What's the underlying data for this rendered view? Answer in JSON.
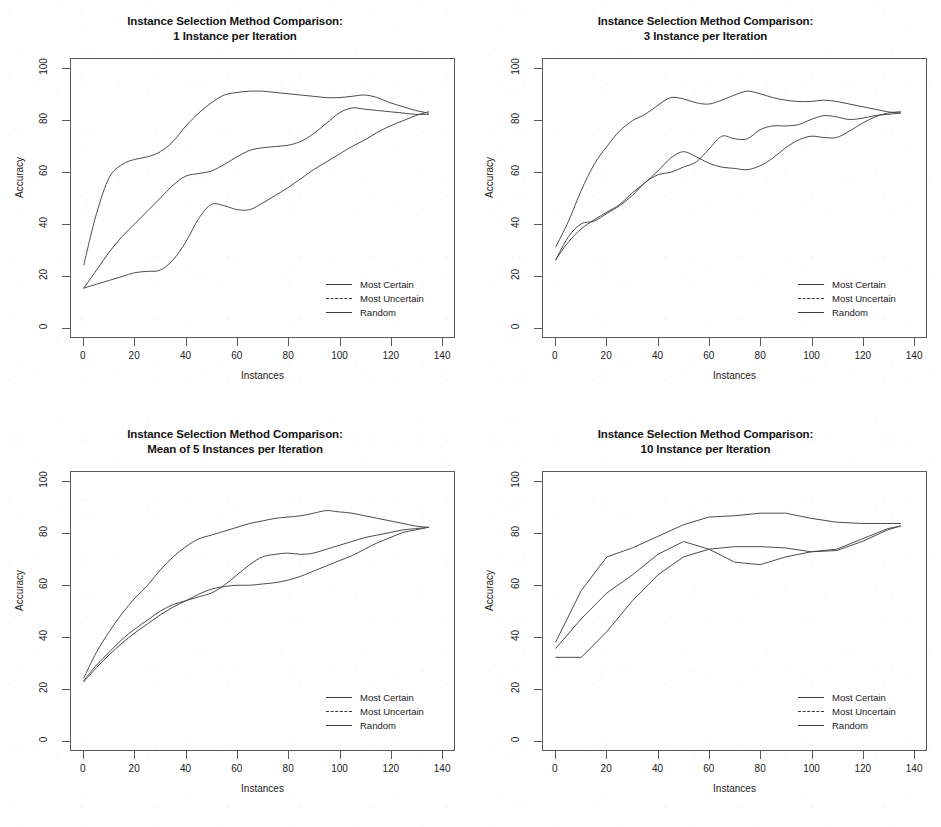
{
  "figure": {
    "title_line1": "Instance Selection Method Comparison:",
    "axis": {
      "xlabel": "Instances",
      "ylabel": "Accuracy",
      "xticks": [
        0,
        20,
        40,
        60,
        80,
        100,
        120,
        140
      ],
      "yticks": [
        0,
        20,
        40,
        60,
        80,
        100
      ],
      "xlim": [
        -5,
        145
      ],
      "ylim": [
        -4,
        104
      ]
    },
    "legend": {
      "entries": [
        {
          "label": "Most Certain",
          "style": "solid",
          "color": "#3a3a3a"
        },
        {
          "label": "Most Uncertain",
          "style": "dashed",
          "color": "#3a3a3a"
        },
        {
          "label": "Random",
          "style": "solid",
          "color": "#3a3a3a"
        }
      ]
    }
  },
  "chart_data": [
    {
      "type": "line",
      "panel": "top-left",
      "title": "Instance Selection Method Comparison:",
      "subtitle": "1 Instance per Iteration",
      "xlabel": "Instances",
      "ylabel": "Accuracy",
      "xlim": [
        -5,
        145
      ],
      "ylim": [
        -4,
        104
      ],
      "xticks": [
        0,
        20,
        40,
        60,
        80,
        100,
        120,
        140
      ],
      "yticks": [
        0,
        20,
        40,
        60,
        80,
        100
      ],
      "grid": false,
      "legend_position": "bottom-right",
      "x": [
        0,
        5,
        10,
        15,
        20,
        25,
        30,
        35,
        40,
        45,
        50,
        55,
        60,
        65,
        70,
        75,
        80,
        85,
        90,
        95,
        100,
        105,
        110,
        115,
        120,
        125,
        130,
        135
      ],
      "series": [
        {
          "name": "Most Certain",
          "values": [
            24,
            44,
            58,
            63,
            65,
            66,
            68,
            72,
            78,
            83,
            87,
            90,
            91,
            91.5,
            91.5,
            91,
            90.5,
            90,
            89.5,
            89,
            89,
            89.5,
            90,
            89,
            87,
            85.5,
            84,
            83
          ]
        },
        {
          "name": "Most Uncertain",
          "values": [
            15,
            22,
            29,
            35,
            40,
            45,
            50,
            55,
            58.5,
            59.5,
            60.5,
            63,
            66,
            68.5,
            69.5,
            70,
            70.5,
            72,
            75,
            79,
            83,
            85,
            84.5,
            84,
            83.5,
            83,
            82.5,
            82.5
          ]
        },
        {
          "name": "Random",
          "values": [
            15,
            16.5,
            18,
            19.5,
            21,
            21.5,
            22,
            26,
            33,
            42,
            47.5,
            47,
            45.5,
            45.5,
            48,
            51,
            54,
            57.5,
            61,
            64,
            67,
            70,
            72.5,
            75.5,
            78,
            80,
            82,
            83.5
          ]
        }
      ]
    },
    {
      "type": "line",
      "panel": "top-right",
      "title": "Instance Selection Method Comparison:",
      "subtitle": "3 Instance per Iteration",
      "xlabel": "Instances",
      "ylabel": "Accuracy",
      "xlim": [
        -5,
        145
      ],
      "ylim": [
        -4,
        104
      ],
      "xticks": [
        0,
        20,
        40,
        60,
        80,
        100,
        120,
        140
      ],
      "yticks": [
        0,
        20,
        40,
        60,
        80,
        100
      ],
      "grid": false,
      "legend_position": "bottom-right",
      "x": [
        0,
        5,
        10,
        15,
        20,
        25,
        30,
        35,
        40,
        45,
        50,
        55,
        60,
        65,
        70,
        75,
        80,
        85,
        90,
        95,
        100,
        105,
        110,
        115,
        120,
        125,
        130,
        135
      ],
      "series": [
        {
          "name": "Most Certain",
          "values": [
            31,
            41,
            53,
            63,
            70,
            76,
            80,
            82.5,
            86,
            89,
            88.5,
            87,
            86.5,
            88,
            90,
            91.5,
            90.5,
            89,
            88,
            87.5,
            87.5,
            88,
            87.5,
            86.5,
            85.5,
            84.5,
            83.5,
            83
          ]
        },
        {
          "name": "Most Uncertain",
          "values": [
            26,
            35,
            40,
            41,
            44,
            47,
            51,
            56,
            59,
            60,
            62,
            64,
            69,
            74,
            73,
            73,
            76.5,
            78,
            78,
            78.5,
            80.5,
            82,
            81.5,
            80.5,
            81,
            82,
            82.5,
            83
          ]
        },
        {
          "name": "Random",
          "values": [
            26,
            33,
            38,
            41.5,
            44.5,
            47.5,
            52,
            56,
            60.5,
            65.5,
            68,
            66,
            63.5,
            62,
            61.5,
            61,
            62.5,
            65.5,
            69.5,
            72.5,
            74,
            73.5,
            73.5,
            76,
            79,
            81.5,
            83,
            83.5
          ]
        }
      ]
    },
    {
      "type": "line",
      "panel": "bottom-left",
      "title": "Instance Selection Method Comparison:",
      "subtitle": "Mean of 5 Instances per Iteration",
      "xlabel": "Instances",
      "ylabel": "Accuracy",
      "xlim": [
        -5,
        145
      ],
      "ylim": [
        -4,
        104
      ],
      "xticks": [
        0,
        20,
        40,
        60,
        80,
        100,
        120,
        140
      ],
      "yticks": [
        0,
        20,
        40,
        60,
        80,
        100
      ],
      "grid": false,
      "legend_position": "bottom-right",
      "x": [
        0,
        5,
        10,
        15,
        20,
        25,
        30,
        35,
        40,
        45,
        50,
        55,
        60,
        65,
        70,
        75,
        80,
        85,
        90,
        95,
        100,
        105,
        110,
        115,
        120,
        125,
        130,
        135
      ],
      "series": [
        {
          "name": "Most Certain",
          "values": [
            24,
            34,
            42,
            49,
            55,
            60,
            66,
            71,
            75,
            78,
            79.5,
            81,
            82.5,
            84,
            85,
            86,
            86.5,
            87,
            88,
            89,
            88.5,
            88,
            87,
            86,
            85,
            84,
            83,
            82.5
          ]
        },
        {
          "name": "Most Uncertain",
          "values": [
            23,
            29,
            34,
            39,
            43,
            46.5,
            50,
            52.5,
            54,
            55.5,
            57,
            60,
            64,
            68,
            71,
            72,
            72.5,
            72,
            72.5,
            74,
            75.5,
            77,
            78.5,
            79.5,
            80.5,
            81.5,
            82,
            82.5
          ]
        },
        {
          "name": "Random",
          "values": [
            22.5,
            28,
            33,
            37.5,
            41.5,
            45,
            48.5,
            51.5,
            54,
            56.5,
            58.5,
            59.5,
            60,
            60,
            60.5,
            61,
            62,
            63.5,
            65.5,
            67.5,
            69.5,
            71.5,
            74,
            76.5,
            78.5,
            80.5,
            81.5,
            82.5
          ]
        }
      ]
    },
    {
      "type": "line",
      "panel": "bottom-right",
      "title": "Instance Selection Method Comparison:",
      "subtitle": "10 Instance per Iteration",
      "xlabel": "Instances",
      "ylabel": "Accuracy",
      "xlim": [
        -5,
        145
      ],
      "ylim": [
        -4,
        104
      ],
      "xticks": [
        0,
        20,
        40,
        60,
        80,
        100,
        120,
        140
      ],
      "yticks": [
        0,
        20,
        40,
        60,
        80,
        100
      ],
      "grid": false,
      "legend_position": "bottom-right",
      "x": [
        0,
        10,
        20,
        30,
        40,
        50,
        60,
        70,
        80,
        90,
        100,
        110,
        120,
        130,
        135
      ],
      "series": [
        {
          "name": "Most Certain",
          "values": [
            38,
            58,
            71,
            74.5,
            79,
            83.5,
            86.5,
            87,
            88,
            88,
            86,
            84.5,
            84,
            84,
            84
          ]
        },
        {
          "name": "Most Uncertain",
          "values": [
            35.5,
            47,
            57,
            64,
            72,
            77,
            74,
            75,
            75,
            74.5,
            73,
            74,
            78,
            82,
            83
          ]
        },
        {
          "name": "Random",
          "values": [
            32,
            32,
            42,
            54,
            64,
            71,
            74,
            69,
            68,
            71,
            73,
            73.5,
            77,
            81.5,
            83
          ]
        }
      ]
    }
  ]
}
